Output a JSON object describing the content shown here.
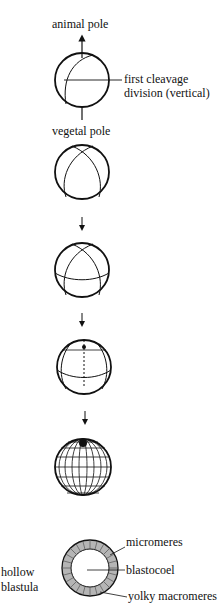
{
  "diagram": {
    "stages": [
      {
        "name": "fertilized egg with first cleavage plane"
      },
      {
        "name": "two-cell stage"
      },
      {
        "name": "four-cell stage"
      },
      {
        "name": "eight-cell stage"
      },
      {
        "name": "morula"
      },
      {
        "name": "hollow blastula"
      }
    ],
    "labels": {
      "animal_pole": "animal pole",
      "vegetal_pole": "vegetal pole",
      "first_cleavage_1": "first cleavage",
      "first_cleavage_2": "division (vertical)",
      "micromeres": "micromeres",
      "blastocoel": "blastocoel",
      "yolky_macromeres": "yolky macromeres",
      "hollow_1": "hollow",
      "hollow_2": "blastula"
    }
  }
}
